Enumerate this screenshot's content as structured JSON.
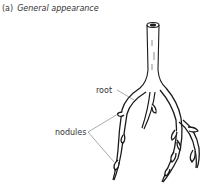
{
  "figure": {
    "panel_label": "(a)",
    "title": "General appearance"
  },
  "labels": {
    "root": "root",
    "nodules": "nodules"
  },
  "colors": {
    "line": "#1a1a1a",
    "text": "#333333",
    "background": "#ffffff"
  }
}
